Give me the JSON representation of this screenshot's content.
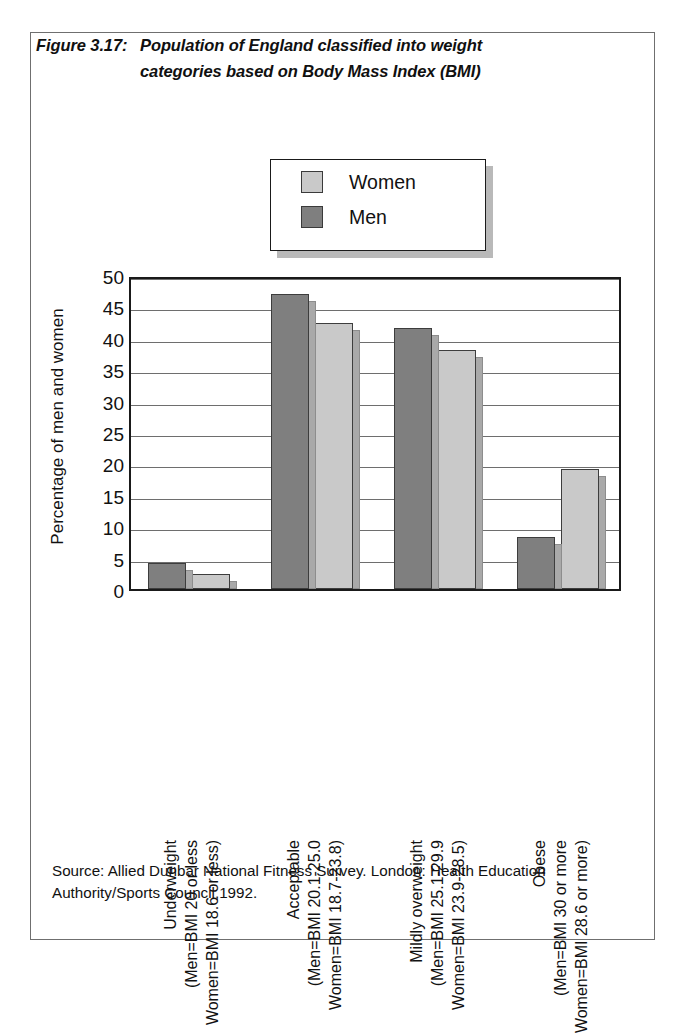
{
  "figure": {
    "number": "Figure 3.17:",
    "title_line1": "Population of England classified into weight",
    "title_line2": "categories based on Body Mass Index (BMI)"
  },
  "legend": {
    "items": [
      {
        "label": "Women",
        "color": "#c9c9c9"
      },
      {
        "label": "Men",
        "color": "#7f7f7f"
      }
    ]
  },
  "source": {
    "line1": "Source: Allied Dunbar National Fitness Survey. London: Health Education",
    "line2": "Authority/Sports Council,1992."
  },
  "chart_data": {
    "type": "bar",
    "xlabel": "",
    "ylabel": "Percentage of men and women",
    "ylim": [
      0,
      50
    ],
    "ytick_step": 5,
    "yticks": [
      0,
      5,
      10,
      15,
      20,
      25,
      30,
      35,
      40,
      45,
      50
    ],
    "ytick_labels": [
      "0",
      "5",
      "10",
      "15",
      "20",
      "25",
      "30",
      "35",
      "40",
      "45",
      "50"
    ],
    "grid": true,
    "legend_position": "above-plot",
    "categories": [
      "Underweight (Men=BMI 20 or less  Women=BMI 18.6 or less)",
      "Acceptable (Men=BMI 20.1-25.0  Women=BMI 18.7-23.8)",
      "Mildly overweight (Men=BMI 25.1-29.9  Women=BMI 23.9-28.5)",
      "Obese (Men=BMI 30 or more  Women=BMI 28.6 or more)"
    ],
    "category_lines": [
      [
        "Underweight",
        "(Men=BMI 20 or less",
        "Women=BMI 18.6 or less)"
      ],
      [
        "Acceptable",
        "(Men=BMI 20.1-25.0",
        "Women=BMI 18.7-23.8)"
      ],
      [
        "Mildly overweight",
        "(Men=BMI 25.1-29.9",
        "Women=BMI 23.9-28.5)"
      ],
      [
        "Obese",
        "(Men=BMI 30 or more",
        "Women=BMI 28.6 or more)"
      ]
    ],
    "series": [
      {
        "name": "Men",
        "color": "#7f7f7f",
        "values": [
          4.2,
          47.0,
          41.5,
          8.3
        ]
      },
      {
        "name": "Women",
        "color": "#c9c9c9",
        "values": [
          2.4,
          42.3,
          38.0,
          19.1
        ]
      }
    ],
    "series_draw_order": [
      "Men",
      "Women"
    ]
  }
}
